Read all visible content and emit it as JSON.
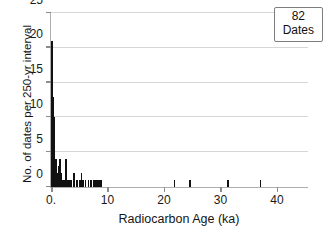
{
  "chart_data": {
    "type": "bar",
    "title": "",
    "xlabel": "Radiocarbon Age (ka)",
    "ylabel": "No. of dates per 250-yr interval",
    "xlim": [
      0,
      45.5
    ],
    "ylim": [
      0,
      25
    ],
    "xticks": [
      0,
      10,
      20,
      30,
      40
    ],
    "xticklabels": [
      "0.",
      "10",
      "20",
      "30",
      "40"
    ],
    "yticks": [
      0,
      5,
      10,
      15,
      20,
      25
    ],
    "yticklabels": [
      "0",
      "5",
      "10",
      "15",
      "20",
      "25"
    ],
    "grid": "horizontal",
    "bin_width_ka": 0.25,
    "bar_color": "#111111",
    "axis_color": "#aeaeae",
    "gridline_color": "#d6d6d6",
    "legend_position": "top-right",
    "x": [
      0.125,
      0.375,
      0.625,
      0.875,
      1.125,
      1.375,
      1.625,
      1.875,
      2.125,
      2.375,
      2.625,
      2.875,
      3.125,
      3.375,
      3.625,
      4.125,
      4.625,
      5.125,
      5.375,
      5.625,
      6.125,
      6.625,
      7.125,
      7.625,
      7.875,
      8.125,
      8.375,
      8.625,
      8.875,
      21.875,
      24.625,
      31.375,
      37.125
    ],
    "values": [
      21,
      13,
      10,
      4,
      2,
      3,
      4,
      2,
      1,
      1,
      4,
      1,
      1,
      1,
      1,
      2,
      1,
      1,
      2,
      1,
      1,
      1,
      1,
      1,
      1,
      1,
      1,
      1,
      1,
      1,
      1,
      1,
      1
    ],
    "annotations": [
      {
        "text_line1": "82",
        "text_line2": "Dates",
        "position": "top-right"
      }
    ]
  },
  "annotation": {
    "count": "82",
    "unit": "Dates"
  },
  "axes": {
    "x_title": "Radiocarbon Age (ka)",
    "y_title": "No. of dates per 250-yr interval"
  }
}
